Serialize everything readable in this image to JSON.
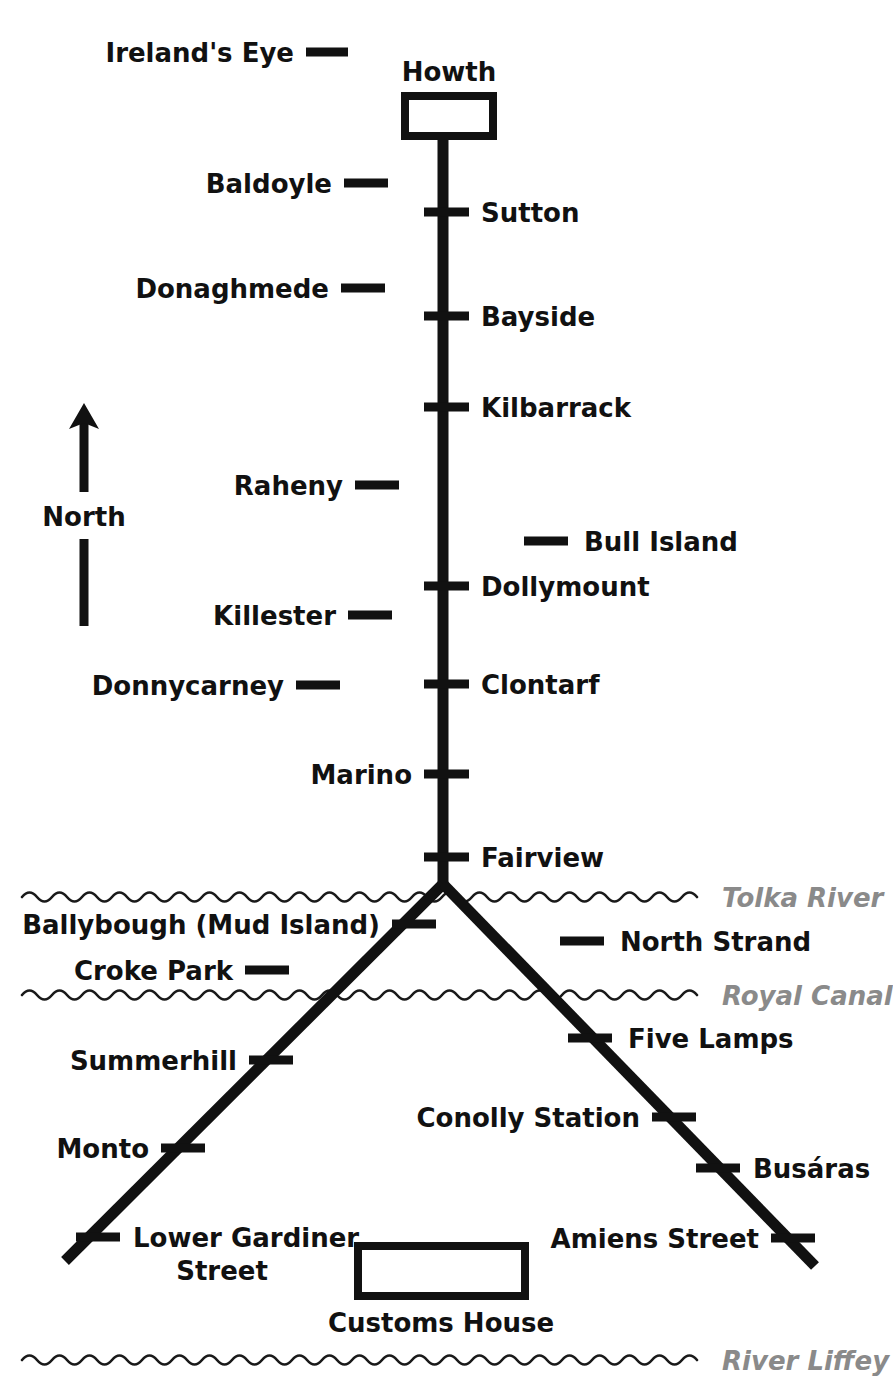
{
  "diagram": {
    "compass": {
      "label": "North",
      "icon": "north-arrow-icon"
    },
    "colors": {
      "ink": "#111111",
      "water_label": "#8a8a8a",
      "background": "#ffffff"
    },
    "termini": [
      {
        "name": "Howth",
        "label": "Howth",
        "shape": "box"
      },
      {
        "name": "Customs House",
        "label": "Customs House",
        "shape": "box"
      }
    ],
    "waterways": [
      {
        "label": "Tolka River",
        "y": 897
      },
      {
        "label": "Royal Canal",
        "y": 995
      },
      {
        "label": "River Liffey",
        "y": 1360
      }
    ],
    "trunk_stops_right": [
      {
        "label": "Sutton",
        "y": 212
      },
      {
        "label": "Bayside",
        "y": 316
      },
      {
        "label": "Kilbarrack",
        "y": 407
      },
      {
        "label": "Dollymount",
        "y": 586
      },
      {
        "label": "Clontarf",
        "y": 684
      },
      {
        "label": "Fairview",
        "y": 857
      }
    ],
    "trunk_stops_left": [
      {
        "label": "Baldoyle",
        "y": 183
      },
      {
        "label": "Donaghmede",
        "y": 288
      },
      {
        "label": "Raheny",
        "y": 485
      },
      {
        "label": "Killester",
        "y": 615
      },
      {
        "label": "Donnycarney",
        "y": 685
      },
      {
        "label": "Marino",
        "y": 774
      }
    ],
    "detached_stops": [
      {
        "label": "Ireland's Eye",
        "side": "left",
        "y": 52
      },
      {
        "label": "Bull Island",
        "side": "right",
        "y": 541
      },
      {
        "label": "North Strand",
        "side": "right",
        "y": 941
      },
      {
        "label": "Croke Park",
        "side": "left",
        "y": 970
      }
    ],
    "west_branch_stops": [
      {
        "label": "Ballybough (Mud Island)",
        "x": 414,
        "y": 924
      },
      {
        "label": "Summerhill",
        "x": 271,
        "y": 1060
      },
      {
        "label": "Monto",
        "x": 183,
        "y": 1148
      },
      {
        "label": "Lower Gardiner Street",
        "label_line_1": "Lower Gardiner",
        "label_line_2": "Street",
        "x": 98,
        "y": 1237
      }
    ],
    "east_branch_stops": [
      {
        "label": "Five Lamps",
        "x": 590,
        "y": 1038
      },
      {
        "label": "Conolly Station",
        "x": 674,
        "y": 1117
      },
      {
        "label": "Busáras",
        "x": 718,
        "y": 1168
      },
      {
        "label": "Amiens Street",
        "x": 793,
        "y": 1238
      }
    ]
  }
}
